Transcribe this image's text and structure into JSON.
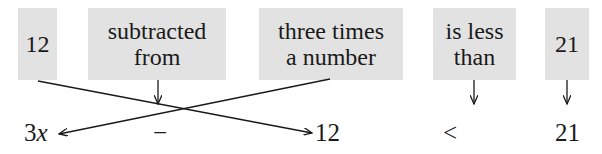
{
  "phrase_boxes": [
    {
      "id": "twelve",
      "text": "12"
    },
    {
      "id": "subtracted-from",
      "text": "subtracted\nfrom"
    },
    {
      "id": "three-times",
      "text": "three times\na number"
    },
    {
      "id": "is-less-than",
      "text": "is less\nthan"
    },
    {
      "id": "twenty-one",
      "text": "21"
    }
  ],
  "expression": {
    "term1_coef": "3",
    "term1_var": "x",
    "operator": "−",
    "term2": "12",
    "relation": "<",
    "rhs": "21"
  },
  "colors": {
    "box_fill": "#e2e2e2",
    "ink": "#1a1a1a"
  }
}
